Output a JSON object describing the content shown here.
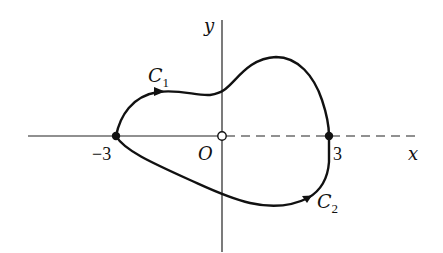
{
  "diagram": {
    "type": "closed-curve-in-plane",
    "axes": {
      "x_label": "x",
      "y_label": "y",
      "origin_label": "O",
      "positive_x_axis_style": "dashed",
      "origin_marker": "open-circle"
    },
    "points": [
      {
        "label": "-3",
        "display": "−3",
        "x": -3,
        "y": 0,
        "marker": "filled-dot"
      },
      {
        "label": "3",
        "display": "3",
        "x": 3,
        "y": 0,
        "marker": "filled-dot"
      }
    ],
    "curves": [
      {
        "name": "C1",
        "label_base": "C",
        "label_sub": "1",
        "from": "-3",
        "to": "3",
        "side": "upper",
        "direction_arrow": "rightward"
      },
      {
        "name": "C2",
        "label_base": "C",
        "label_sub": "2",
        "from": "-3",
        "to": "3",
        "side": "lower",
        "direction_arrow": "rightward"
      }
    ],
    "colors": {
      "ink": "#111111",
      "background": "#ffffff"
    }
  }
}
